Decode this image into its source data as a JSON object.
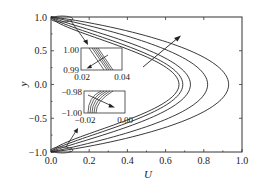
{
  "chart_data": {
    "type": "line",
    "title": "",
    "xlabel": "U",
    "ylabel": "y",
    "xlim": [
      0.0,
      1.0
    ],
    "ylim": [
      -1.0,
      1.0
    ],
    "x_ticks": [
      "0.0",
      "0.2",
      "0.4",
      "0.6",
      "0.8",
      "1.0"
    ],
    "y_ticks": [
      "1.0",
      "0.5",
      "0.0",
      "-0.5",
      "-1.0"
    ],
    "grid": false,
    "legend": null,
    "series": [
      {
        "name": "curve-1",
        "peak_U": 0.67,
        "shape": "parabolic-like, U(±1)=0"
      },
      {
        "name": "curve-2",
        "peak_U": 0.69,
        "shape": "parabolic-like, U(±1)=0"
      },
      {
        "name": "curve-3",
        "peak_U": 0.73,
        "shape": "parabolic-like, U(±1)=0"
      },
      {
        "name": "curve-4",
        "peak_U": 0.82,
        "shape": "parabolic-like, U(±1)=0"
      },
      {
        "name": "curve-5",
        "peak_U": 0.93,
        "shape": "parabolic-like, U(±1)=0"
      }
    ],
    "annotations": [
      {
        "type": "arrow",
        "description": "trend arrow pointing toward increasing U across curves"
      },
      {
        "type": "inset",
        "position": "upper",
        "x_ticks": [
          "0.02",
          "0.04"
        ],
        "y_ticks": [
          "1.00",
          "0.99"
        ],
        "description": "zoom of near-wall region at y≈1"
      },
      {
        "type": "inset",
        "position": "lower",
        "x_ticks": [
          "-0.02",
          "0.00"
        ],
        "y_ticks": [
          "-0.98",
          "-1.00"
        ],
        "description": "zoom of near-wall region at y≈-1"
      }
    ]
  },
  "labels": {
    "xlabel": "U",
    "ylabel": "y",
    "x_ticks": [
      "0.0",
      "0.2",
      "0.4",
      "0.6",
      "0.8",
      "1.0"
    ],
    "y_ticks": [
      "1.0",
      "0.5",
      "0.0",
      "−0.5",
      "−1.0"
    ],
    "inset_top": {
      "y_top": "1.00",
      "y_bottom": "0.99",
      "x_left": "0.02",
      "x_right": "0.04"
    },
    "inset_bottom": {
      "y_top": "−0.98",
      "y_bottom": "−1.00",
      "x_left": "−0.02",
      "x_right": "0.00"
    }
  }
}
